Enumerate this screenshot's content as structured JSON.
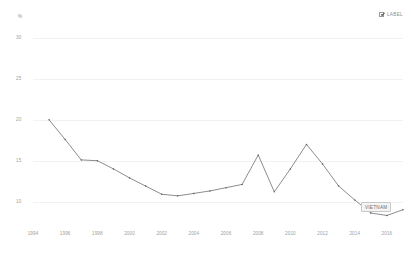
{
  "legend": {
    "swatch_icon": "checkbox-checked-icon",
    "label": "LABEL",
    "checked": true
  },
  "axis": {
    "y_unit": "%",
    "y_ticks": [
      "30",
      "25",
      "20",
      "15",
      "10"
    ],
    "x_ticks": [
      "1994",
      "1996",
      "1998",
      "2000",
      "2002",
      "2004",
      "2006",
      "2008",
      "2010",
      "2012",
      "2014",
      "2016"
    ]
  },
  "series_label": {
    "text": "VIETNAM"
  },
  "colors": {
    "line": "#6e6e6e",
    "grid": "#f2f2f2",
    "text": "#9e9e9e",
    "label_bg": "#f4f4f4",
    "label_border": "#c8c8c8"
  },
  "chart_data": {
    "type": "line",
    "title": "",
    "xlabel": "",
    "ylabel": "%",
    "xlim": [
      1994,
      2017
    ],
    "ylim": [
      7.5,
      31
    ],
    "grid": true,
    "legend_position": "top-right",
    "x_tick_values": [
      1994,
      1996,
      1998,
      2000,
      2002,
      2004,
      2006,
      2008,
      2010,
      2012,
      2014,
      2016
    ],
    "y_tick_values": [
      30,
      25,
      20,
      15,
      10
    ],
    "annotations": [
      {
        "text": "VIETNAM",
        "x": 2016,
        "y": 8.6
      }
    ],
    "series": [
      {
        "name": "VIETNAM",
        "x": [
          1995,
          1996,
          1997,
          1998,
          1999,
          2000,
          2001,
          2002,
          2003,
          2004,
          2005,
          2006,
          2007,
          2008,
          2009,
          2010,
          2011,
          2012,
          2013,
          2014,
          2015,
          2016,
          2017
        ],
        "values": [
          20.0,
          17.6,
          15.1,
          15.0,
          14.0,
          12.9,
          11.9,
          10.9,
          10.7,
          11.0,
          11.3,
          11.7,
          12.1,
          15.7,
          11.2,
          14.0,
          17.0,
          14.6,
          11.9,
          10.2,
          8.6,
          8.3,
          9.0
        ]
      }
    ]
  }
}
